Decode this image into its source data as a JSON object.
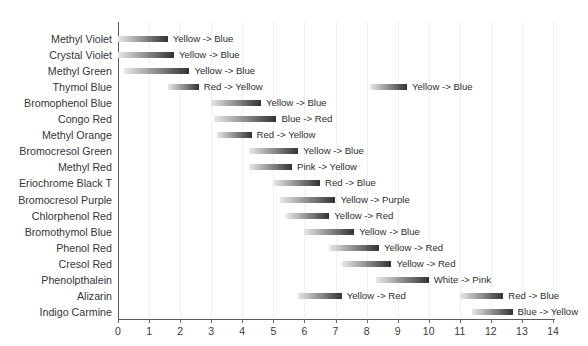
{
  "chart_data": {
    "type": "bar",
    "orientation": "horizontal",
    "title": "",
    "subtitle": "",
    "xlabel": "",
    "ylabel": "",
    "xlim": [
      0,
      14
    ],
    "xticks": [
      0,
      1,
      2,
      3,
      4,
      5,
      6,
      7,
      8,
      9,
      10,
      11,
      12,
      13,
      14
    ],
    "xticklabels": [
      "0",
      "1",
      "2",
      "3",
      "4",
      "5",
      "6",
      "7",
      "8",
      "9",
      "10",
      "11",
      "12",
      "13",
      "14"
    ],
    "grid": "vertical",
    "legend": "none",
    "bar_color_start": "#e8e8e8",
    "bar_color_end": "#333333",
    "categories": [
      "Methyl Violet",
      "Crystal Violet",
      "Methyl Green",
      "Thymol Blue",
      "Bromophenol Blue",
      "Congo Red",
      "Methyl Orange",
      "Bromocresol Green",
      "Methyl Red",
      "Eriochrome Black T",
      "Bromocresol Purple",
      "Chlorphenol Red",
      "Bromothymol Blue",
      "Phenol Red",
      "Cresol Red",
      "Phenolpthalein",
      "Alizarin",
      "Indigo Carmine"
    ],
    "ranges": [
      {
        "indicator": "Methyl Violet",
        "bars": [
          {
            "start": 0.0,
            "end": 1.6,
            "label": "Yellow -> Blue"
          }
        ]
      },
      {
        "indicator": "Crystal Violet",
        "bars": [
          {
            "start": 0.0,
            "end": 1.8,
            "label": "Yellow -> Blue"
          }
        ]
      },
      {
        "indicator": "Methyl Green",
        "bars": [
          {
            "start": 0.2,
            "end": 2.3,
            "label": "Yellow -> Blue"
          }
        ]
      },
      {
        "indicator": "Thymol Blue",
        "bars": [
          {
            "start": 1.6,
            "end": 2.6,
            "label": "Red -> Yellow"
          },
          {
            "start": 8.1,
            "end": 9.3,
            "label": "Yellow -> Blue"
          }
        ]
      },
      {
        "indicator": "Bromophenol Blue",
        "bars": [
          {
            "start": 3.0,
            "end": 4.6,
            "label": "Yellow -> Blue"
          }
        ]
      },
      {
        "indicator": "Congo Red",
        "bars": [
          {
            "start": 3.1,
            "end": 5.1,
            "label": "Blue -> Red"
          }
        ]
      },
      {
        "indicator": "Methyl Orange",
        "bars": [
          {
            "start": 3.2,
            "end": 4.3,
            "label": "Red -> Yellow"
          }
        ]
      },
      {
        "indicator": "Bromocresol Green",
        "bars": [
          {
            "start": 4.2,
            "end": 5.8,
            "label": "Yellow -> Blue"
          }
        ]
      },
      {
        "indicator": "Methyl Red",
        "bars": [
          {
            "start": 4.2,
            "end": 5.6,
            "label": "Pink -> Yellow"
          }
        ]
      },
      {
        "indicator": "Eriochrome Black T",
        "bars": [
          {
            "start": 5.0,
            "end": 6.5,
            "label": "Red -> Blue"
          }
        ]
      },
      {
        "indicator": "Bromocresol Purple",
        "bars": [
          {
            "start": 5.2,
            "end": 7.0,
            "label": "Yellow -> Purple"
          }
        ]
      },
      {
        "indicator": "Chlorphenol Red",
        "bars": [
          {
            "start": 5.4,
            "end": 6.8,
            "label": "Yellow -> Red"
          }
        ]
      },
      {
        "indicator": "Bromothymol Blue",
        "bars": [
          {
            "start": 6.0,
            "end": 7.6,
            "label": "Yellow -> Blue"
          }
        ]
      },
      {
        "indicator": "Phenol Red",
        "bars": [
          {
            "start": 6.8,
            "end": 8.4,
            "label": "Yellow -> Red"
          }
        ]
      },
      {
        "indicator": "Cresol Red",
        "bars": [
          {
            "start": 7.2,
            "end": 8.8,
            "label": "Yellow -> Red"
          }
        ]
      },
      {
        "indicator": "Phenolpthalein",
        "bars": [
          {
            "start": 8.3,
            "end": 10.0,
            "label": "White -> Pink"
          }
        ]
      },
      {
        "indicator": "Alizarin",
        "bars": [
          {
            "start": 5.8,
            "end": 7.2,
            "label": "Yellow -> Red"
          },
          {
            "start": 11.0,
            "end": 12.4,
            "label": "Red -> Blue"
          }
        ]
      },
      {
        "indicator": "Indigo Carmine",
        "bars": [
          {
            "start": 11.4,
            "end": 12.7,
            "label": "Blue -> Yellow"
          }
        ]
      }
    ]
  }
}
